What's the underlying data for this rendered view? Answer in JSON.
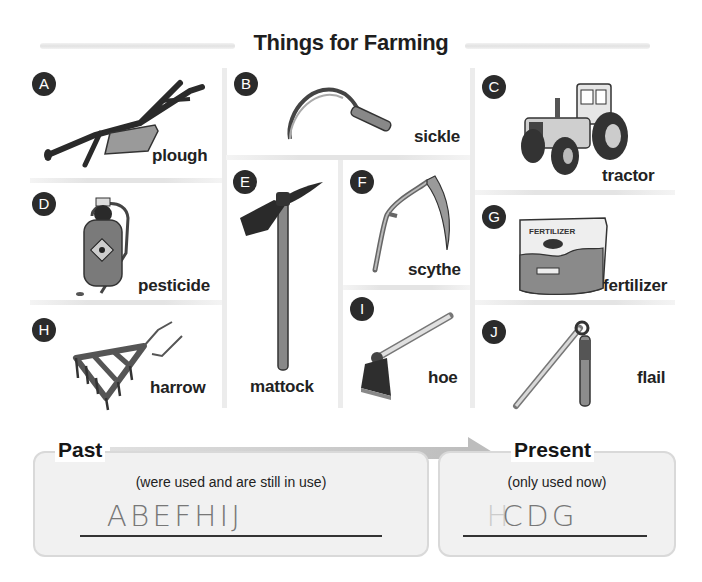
{
  "page": {
    "title": "Things for Farming"
  },
  "items": [
    {
      "letter": "A",
      "name": "plough"
    },
    {
      "letter": "B",
      "name": "sickle"
    },
    {
      "letter": "C",
      "name": "tractor"
    },
    {
      "letter": "D",
      "name": "pesticide"
    },
    {
      "letter": "E",
      "name": "mattock"
    },
    {
      "letter": "F",
      "name": "scythe"
    },
    {
      "letter": "G",
      "name": "fertilizer"
    },
    {
      "letter": "H",
      "name": "harrow"
    },
    {
      "letter": "I",
      "name": "hoe"
    },
    {
      "letter": "J",
      "name": "flail"
    }
  ],
  "fertilizer_bag_text": "FERTILIZER",
  "timeline": {
    "past": {
      "heading": "Past",
      "subtitle": "(were used and are still in use)",
      "answer": "ABEFHIJ"
    },
    "present": {
      "heading": "Present",
      "subtitle": "(only used now)",
      "answer": "CDG",
      "answer_scribble": "H"
    }
  },
  "colors": {
    "badge": "#2b2b2b",
    "arrow": "#bdbdbd",
    "box_fill": "#f1f1f1",
    "box_border": "#d9d9d9",
    "handwriting": "#777777"
  }
}
